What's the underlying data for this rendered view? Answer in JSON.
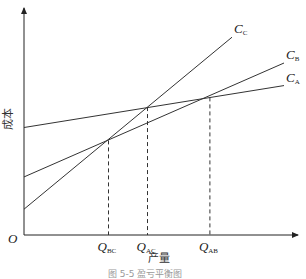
{
  "chart_data": {
    "type": "line",
    "title": "",
    "caption": "图 5-5  盈亏平衡图",
    "xlabel": "产量",
    "ylabel": "成本",
    "origin_label": "O",
    "xlim": [
      0,
      10
    ],
    "ylim": [
      0,
      10
    ],
    "series": [
      {
        "name": "C",
        "sub": "A",
        "x": [
          0,
          10
        ],
        "y": [
          5.0,
          6.95
        ]
      },
      {
        "name": "C",
        "sub": "B",
        "x": [
          0,
          10
        ],
        "y": [
          2.7,
          8.0
        ]
      },
      {
        "name": "C",
        "sub": "C",
        "x": [
          0,
          8
        ],
        "y": [
          1.2,
          9.2
        ]
      }
    ],
    "markers": [
      {
        "name": "Q",
        "sub": "BC",
        "x": 3.25,
        "y": 4.4
      },
      {
        "name": "Q",
        "sub": "AC",
        "x": 4.75,
        "y": 5.95
      },
      {
        "name": "Q",
        "sub": "AB",
        "x": 7.15,
        "y": 6.4
      }
    ]
  }
}
